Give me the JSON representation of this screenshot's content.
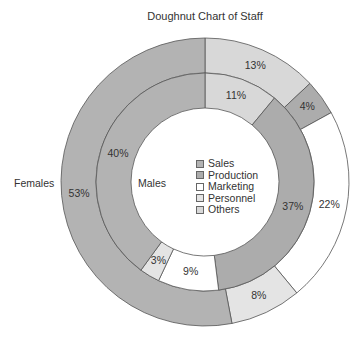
{
  "chart_data": {
    "type": "doughnut",
    "title": "Doughnut Chart of Staff",
    "categories": [
      "Sales",
      "Production",
      "Marketing",
      "Personnel",
      "Others"
    ],
    "colors": {
      "Sales": "#b3b3b3",
      "Production": "#acacac",
      "Marketing": "#ffffff",
      "Personnel": "#e4e4e4",
      "Others": "#d8d8d8"
    },
    "series": [
      {
        "name": "Females",
        "ring": "outer",
        "values": {
          "Sales": 53,
          "Production": 4,
          "Marketing": 22,
          "Personnel": 8,
          "Others": 13
        },
        "clockwise_order_from_top": [
          "Others",
          "Production",
          "Marketing",
          "Personnel",
          "Sales"
        ]
      },
      {
        "name": "Males",
        "ring": "inner",
        "values": {
          "Sales": 40,
          "Production": 37,
          "Marketing": 9,
          "Personnel": 3,
          "Others": 11
        },
        "clockwise_order_from_top": [
          "Others",
          "Production",
          "Marketing",
          "Personnel",
          "Sales"
        ]
      }
    ],
    "legend": {
      "position": "center",
      "entries": [
        "Sales",
        "Production",
        "Marketing",
        "Personnel",
        "Others"
      ]
    },
    "label_format": "percent"
  },
  "geometry": {
    "cx": 205,
    "cy": 182,
    "r_outer": 144,
    "r_mid": 109,
    "r_inner": 74
  }
}
